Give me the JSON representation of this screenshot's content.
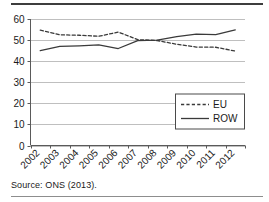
{
  "figure": {
    "source_note": "Source: ONS (2013)."
  },
  "chart_data": {
    "type": "line",
    "title": "",
    "subtitle": "",
    "xlabel": "",
    "ylabel": "",
    "categories": [
      "2002",
      "2003",
      "2004",
      "2005",
      "2006",
      "2007",
      "2008",
      "2009",
      "2010",
      "2011",
      "2012"
    ],
    "series": [
      {
        "name": "EU",
        "style": "dashed",
        "color": "#3a3a3a",
        "values": [
          54.7,
          52.5,
          52.3,
          51.8,
          53.8,
          50.2,
          49.8,
          48.0,
          46.7,
          46.6,
          44.8
        ]
      },
      {
        "name": "ROW",
        "style": "solid",
        "color": "#3a3a3a",
        "values": [
          45.0,
          47.0,
          47.3,
          47.7,
          46.0,
          49.7,
          50.0,
          51.6,
          52.8,
          52.6,
          54.8
        ]
      }
    ],
    "ylim": [
      0,
      60
    ],
    "yticks": [
      0,
      10,
      20,
      30,
      40,
      50,
      60
    ],
    "ytick_labels": [
      "0",
      "10",
      "20",
      "30",
      "40",
      "50",
      "60"
    ],
    "xtick_labels": [
      "2002",
      "2003",
      "2004",
      "2005",
      "2006",
      "2007",
      "2008",
      "2009",
      "2010",
      "2011",
      "2012"
    ],
    "xtick_rotation": -45,
    "grid": true,
    "grid_axis": "y",
    "legend": {
      "position": "bottom-right",
      "entries": [
        {
          "label": "EU",
          "style": "dashed"
        },
        {
          "label": "ROW",
          "style": "solid"
        }
      ]
    }
  }
}
